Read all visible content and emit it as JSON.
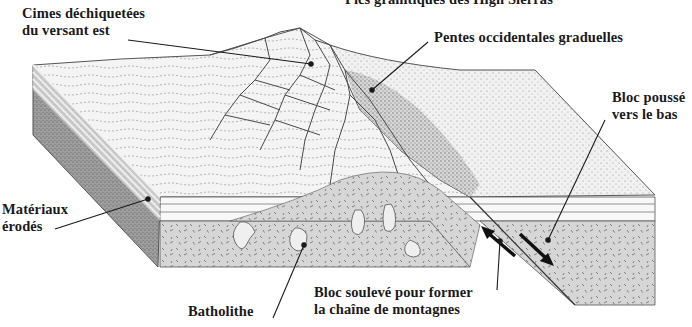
{
  "diagram": {
    "title_cropped": "Pics granitiques des High Sierras",
    "labels": [
      {
        "id": "cimes",
        "lines": [
          "Cimes déchiquetées",
          "du versant est"
        ]
      },
      {
        "id": "pentes",
        "lines": [
          "Pentes occidentales graduelles"
        ]
      },
      {
        "id": "bloc-pousse",
        "lines": [
          "Bloc poussé",
          "vers le bas"
        ]
      },
      {
        "id": "materiaux",
        "lines": [
          "Matériaux",
          "érodés"
        ]
      },
      {
        "id": "batholithe",
        "lines": [
          "Batholithe"
        ]
      },
      {
        "id": "bloc-souleve",
        "lines": [
          "Bloc soulevé pour former",
          "la chaîne de montagnes"
        ]
      }
    ],
    "colors": {
      "ink": "#1a1a1a",
      "stipple_dark": "#6e6e6e",
      "face_gray": "#bdbdbd",
      "background": "#ffffff"
    }
  }
}
